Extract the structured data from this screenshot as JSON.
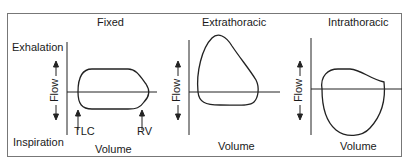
{
  "panels": [
    {
      "title": "Fixed",
      "x_label": "Volume",
      "y_label": "Flow",
      "markers": [
        "TLC",
        "RV"
      ]
    },
    {
      "title": "Extrathoracic",
      "x_label": "Volume",
      "y_label": "Flow"
    },
    {
      "title": "Intrathoracic",
      "x_label": "Volume",
      "y_label": "Flow"
    }
  ],
  "side_labels": {
    "top": "Exhalation",
    "bottom": "Inspiration"
  }
}
